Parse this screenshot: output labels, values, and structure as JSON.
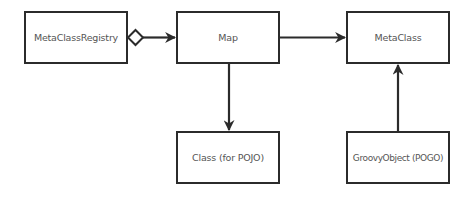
{
  "diagram": {
    "nodes": [
      {
        "id": "metaclassregistry",
        "label": "MetaClassRegistry",
        "x": 24,
        "y": 11,
        "w": 104,
        "h": 53
      },
      {
        "id": "map",
        "label": "Map",
        "x": 176,
        "y": 11,
        "w": 104,
        "h": 53
      },
      {
        "id": "metaclass",
        "label": "MetaClass",
        "x": 346,
        "y": 11,
        "w": 104,
        "h": 53
      },
      {
        "id": "class-pojo",
        "label": "Class (for POJO)",
        "x": 176,
        "y": 131,
        "w": 104,
        "h": 53
      },
      {
        "id": "groovyobject-pogo",
        "label": "GroovyObject (POGO)",
        "x": 346,
        "y": 131,
        "w": 104,
        "h": 53
      }
    ],
    "edges": [
      {
        "from": "MetaClassRegistry",
        "to": "Map",
        "type": "aggregation",
        "source_end": "hollow-diamond",
        "target_end": "filled-arrow"
      },
      {
        "from": "Map",
        "to": "MetaClass",
        "type": "association",
        "target_end": "filled-arrow"
      },
      {
        "from": "Map",
        "to": "Class (for POJO)",
        "type": "association",
        "target_end": "filled-arrow"
      },
      {
        "from": "GroovyObject (POGO)",
        "to": "MetaClass",
        "type": "association",
        "target_end": "filled-arrow"
      }
    ],
    "colors": {
      "stroke": "#2b2b2b",
      "text": "#555555",
      "background": "#ffffff"
    }
  }
}
